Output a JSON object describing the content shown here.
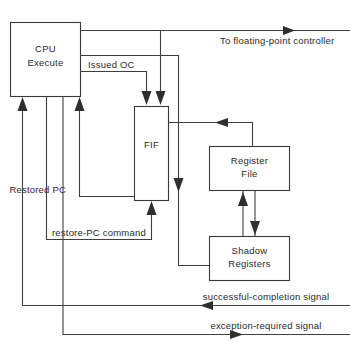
{
  "diagram": {
    "blocks": [
      {
        "id": "cpu-execute",
        "label_line1": "CPU",
        "label_line2": "Execute"
      },
      {
        "id": "fif",
        "label_line1": "FIF",
        "label_line2": ""
      },
      {
        "id": "register-file",
        "label_line1": "Register",
        "label_line2": "File"
      },
      {
        "id": "shadow-registers",
        "label_line1": "Shadow",
        "label_line2": "Registers"
      }
    ],
    "signals": [
      {
        "id": "to-floating-point-controller",
        "label": "To floating-point controller"
      },
      {
        "id": "issued-oc",
        "label": "Issued OC"
      },
      {
        "id": "restored-pc",
        "label": "Restored PC"
      },
      {
        "id": "restore-pc-command",
        "label": "restore-PC command"
      },
      {
        "id": "successful-completion-signal",
        "label": "successful-completion signal"
      },
      {
        "id": "exception-required-signal",
        "label": "exception-required signal"
      }
    ],
    "colors": {
      "stroke": "#3f3f3f",
      "text": "#2b2b2b",
      "background": "#ffffff"
    }
  }
}
